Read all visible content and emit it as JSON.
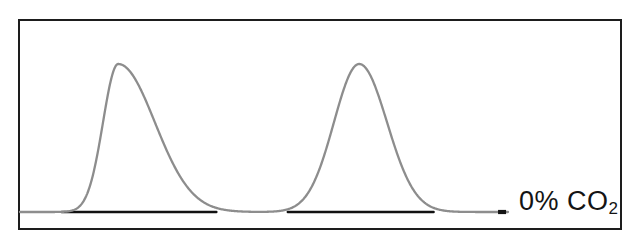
{
  "chart_data": {
    "type": "line",
    "title": "",
    "subtitle": "",
    "xlabel": "",
    "ylabel": "",
    "xlim": [
      0,
      100
    ],
    "ylim": [
      0,
      1.12
    ],
    "grid": false,
    "legend_position": "inline-right",
    "axis_ticks": {
      "x": [],
      "y": []
    },
    "annotations": [
      {
        "name": "series-label",
        "text": "0% CO2",
        "display_text": "0% CO₂",
        "base": "0% CO",
        "subscript": "2",
        "x": 92,
        "y": 0.04,
        "color": "#141414"
      }
    ],
    "series": [
      {
        "name": "chromatogram-trace",
        "color": "#8d8d8d",
        "line_width": 2.2,
        "description": "two resolved gaussian peaks on a flat baseline",
        "peaks": [
          {
            "label": "peak-1",
            "center": 16.5,
            "apex_height": 1.0,
            "base_start": 10.5,
            "base_end": 31.0,
            "width_front": 6.0,
            "width_tail": 14.5,
            "shape": "tailing"
          },
          {
            "label": "peak-2",
            "center": 57.0,
            "apex_height": 1.0,
            "base_start": 47.0,
            "base_end": 68.0,
            "width_front": 10.0,
            "width_tail": 11.0,
            "shape": "near-symmetric"
          }
        ],
        "baseline_value": 0.0,
        "x_start": 0,
        "x_end": 82
      },
      {
        "name": "baseline-integration-trace",
        "color": "#111111",
        "line_width": 2.0,
        "description": "dark integration baseline drawn beneath each peak",
        "segments": [
          {
            "label": "baseline-segment-1",
            "x_start": 7.0,
            "x_end": 33.0,
            "y": 0.0
          },
          {
            "label": "baseline-segment-2",
            "x_start": 45.0,
            "x_end": 69.5,
            "y": 0.0
          }
        ]
      },
      {
        "name": "end-marker",
        "color": "#141414",
        "description": "short dash marker at the end of the trace",
        "x": 81.0,
        "y": 0.0
      }
    ]
  },
  "frame": {
    "border_color": "#1d1d1d",
    "background_color": "#ffffff",
    "border_width_px": 2
  }
}
